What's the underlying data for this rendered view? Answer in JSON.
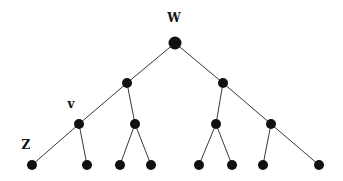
{
  "diagram": {
    "type": "binary-tree",
    "labels": {
      "root": "W",
      "v": "v",
      "z": "Z"
    },
    "label_positions": [
      {
        "key": "root",
        "x": 174,
        "y": 22
      },
      {
        "key": "v",
        "x": 71,
        "y": 108
      },
      {
        "key": "z",
        "x": 26,
        "y": 149
      }
    ],
    "nodes": [
      {
        "id": "w",
        "x": 175,
        "y": 43,
        "r": 6.5,
        "label": "W"
      },
      {
        "id": "l1a",
        "x": 127,
        "y": 83,
        "r": 5
      },
      {
        "id": "l1b",
        "x": 223,
        "y": 83,
        "r": 5
      },
      {
        "id": "v",
        "x": 79,
        "y": 124,
        "r": 5,
        "label": "v"
      },
      {
        "id": "l2b",
        "x": 135,
        "y": 124,
        "r": 5
      },
      {
        "id": "l2c",
        "x": 216,
        "y": 124,
        "r": 5
      },
      {
        "id": "l2d",
        "x": 271,
        "y": 124,
        "r": 5
      },
      {
        "id": "z",
        "x": 32,
        "y": 165,
        "r": 5,
        "label": "Z"
      },
      {
        "id": "lf2",
        "x": 87,
        "y": 165,
        "r": 5
      },
      {
        "id": "lf3",
        "x": 120,
        "y": 165,
        "r": 5
      },
      {
        "id": "lf4",
        "x": 151,
        "y": 165,
        "r": 5
      },
      {
        "id": "lf5",
        "x": 199,
        "y": 165,
        "r": 5
      },
      {
        "id": "lf6",
        "x": 232,
        "y": 165,
        "r": 5
      },
      {
        "id": "lf7",
        "x": 263,
        "y": 165,
        "r": 5
      },
      {
        "id": "lf8",
        "x": 319,
        "y": 165,
        "r": 5
      }
    ],
    "edges": [
      [
        "w",
        "l1a"
      ],
      [
        "w",
        "l1b"
      ],
      [
        "l1a",
        "v"
      ],
      [
        "l1a",
        "l2b"
      ],
      [
        "l1b",
        "l2c"
      ],
      [
        "l1b",
        "l2d"
      ],
      [
        "v",
        "z"
      ],
      [
        "v",
        "lf2"
      ],
      [
        "l2b",
        "lf3"
      ],
      [
        "l2b",
        "lf4"
      ],
      [
        "l2c",
        "lf5"
      ],
      [
        "l2c",
        "lf6"
      ],
      [
        "l2d",
        "lf7"
      ],
      [
        "l2d",
        "lf8"
      ]
    ]
  }
}
